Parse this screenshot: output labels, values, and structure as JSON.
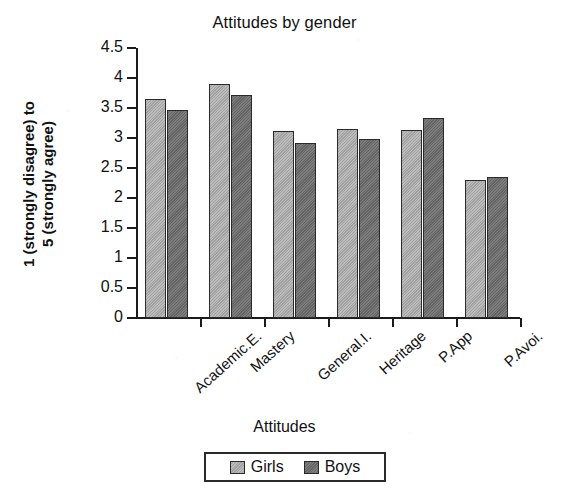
{
  "chart_data": {
    "type": "bar",
    "title": "Attitudes by gender",
    "xlabel": "Attitudes",
    "ylabel": "1 (strongly disagree) to 5 (strongly agree)",
    "ylabel_line1": "1 (strongly disagree) to",
    "ylabel_line2": "5 (strongly agree)",
    "categories": [
      "Academic.E.",
      "Mastery",
      "General.I.",
      "Heritage",
      "P.App",
      "P.Avoi."
    ],
    "series": [
      {
        "name": "Girls",
        "color": "#a9a9a9",
        "values": [
          3.65,
          3.9,
          3.12,
          3.15,
          3.13,
          2.3
        ]
      },
      {
        "name": "Boys",
        "color": "#6b6b6b",
        "values": [
          3.47,
          3.72,
          2.92,
          2.98,
          3.33,
          2.35
        ]
      }
    ],
    "ylim": [
      0,
      4.5
    ],
    "yticks": [
      0,
      0.5,
      1,
      1.5,
      2,
      2.5,
      3,
      3.5,
      4,
      4.5
    ],
    "ytick_labels": [
      "0",
      "0.5",
      "1",
      "1.5",
      "2",
      "2.5",
      "3",
      "3.5",
      "4",
      "4.5"
    ],
    "grid": false,
    "legend_position": "bottom"
  }
}
